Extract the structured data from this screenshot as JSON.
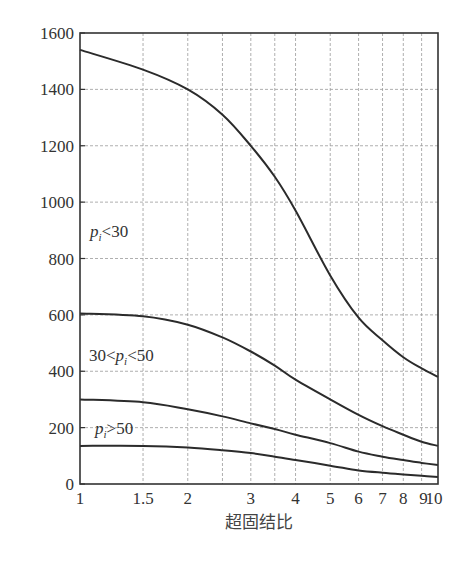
{
  "chart_data": {
    "type": "line",
    "title": "",
    "xlabel": "超固结比",
    "ylabel": "",
    "xscale": "log",
    "xlim": [
      1,
      10
    ],
    "ylim": [
      0,
      1600
    ],
    "grid": true,
    "x_ticks": [
      1,
      1.5,
      2,
      3,
      4,
      5,
      6,
      7,
      8,
      9,
      10
    ],
    "x_tick_labels": [
      "1",
      "1.5",
      "2",
      "3",
      "4",
      "5",
      "6",
      "7",
      "8",
      "9",
      "10"
    ],
    "x_gridlines": [
      1.5,
      2,
      2.5,
      3,
      3.5,
      4,
      5,
      6,
      7,
      8,
      9
    ],
    "y_ticks": [
      0,
      200,
      400,
      600,
      800,
      1000,
      1200,
      1400,
      1600
    ],
    "y_tick_labels": [
      "0",
      "200",
      "400",
      "600",
      "800",
      "1000",
      "1200",
      "1400",
      "1600"
    ],
    "x": [
      1,
      1.5,
      2,
      2.5,
      3,
      3.5,
      4,
      5,
      6,
      7,
      8,
      9,
      10
    ],
    "series": [
      {
        "name": "p_i<30",
        "values": [
          1540,
          1470,
          1400,
          1310,
          1200,
          1090,
          970,
          740,
          590,
          510,
          450,
          410,
          380
        ]
      },
      {
        "name": "30<p_i<50",
        "values": [
          605,
          595,
          565,
          520,
          470,
          420,
          370,
          300,
          245,
          205,
          175,
          150,
          135
        ]
      },
      {
        "name": "p_i>50",
        "values": [
          300,
          290,
          265,
          240,
          215,
          195,
          175,
          145,
          115,
          97,
          85,
          75,
          67
        ]
      },
      {
        "name": "bottom-curve",
        "values": [
          135,
          135,
          130,
          120,
          110,
          97,
          85,
          65,
          48,
          40,
          34,
          29,
          25
        ]
      }
    ],
    "annotations": [
      {
        "text_main": "p",
        "text_sub": "i",
        "text_tail": "<30",
        "x": 1.04,
        "y": 890
      },
      {
        "text_pre": "30<",
        "text_main": "p",
        "text_sub": "i",
        "text_tail": "<50",
        "x": 1.04,
        "y": 450
      },
      {
        "text_main": "p",
        "text_sub": "i",
        "text_tail": ">50",
        "x": 1.04,
        "y": 175
      }
    ]
  },
  "labels": {
    "xlabel": "超固结比",
    "ann_0": {
      "main": "p",
      "sub": "i",
      "tail": "<30"
    },
    "ann_1": {
      "pre": "30<",
      "main": "p",
      "sub": "i",
      "tail": "<50"
    },
    "ann_2": {
      "main": "p",
      "sub": "i",
      "tail": ">50"
    }
  },
  "colors": {
    "curve": "#2b2b2b",
    "frame": "#333333",
    "grid": "#9a9a9a"
  }
}
